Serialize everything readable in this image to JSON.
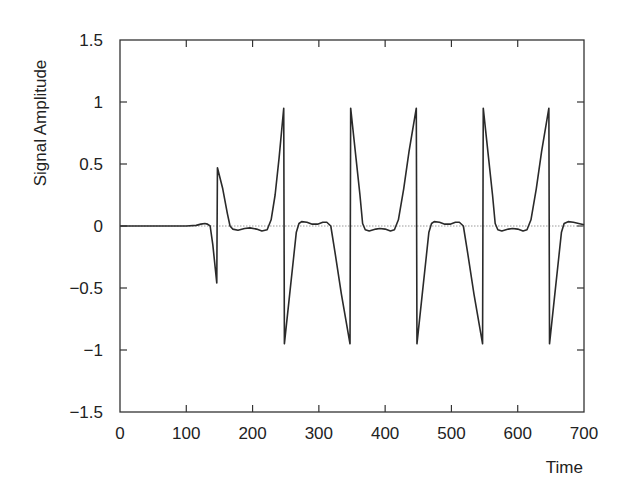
{
  "chart_data": {
    "type": "line",
    "title": "",
    "xlabel": "Time",
    "ylabel": "Signal Amplitude",
    "xlim": [
      0,
      700
    ],
    "ylim": [
      -1.5,
      1.5
    ],
    "grid": false,
    "legend": null,
    "zero_reference_line": {
      "y": 0,
      "style": "dotted",
      "color": "#9a9a9a"
    },
    "xticks": [
      0,
      100,
      200,
      300,
      400,
      500,
      600,
      700
    ],
    "xtick_labels": [
      "0",
      "100",
      "200",
      "300",
      "400",
      "500",
      "600",
      "700"
    ],
    "yticks": [
      -1.5,
      -1,
      -0.5,
      0,
      0.5,
      1,
      1.5
    ],
    "ytick_labels": [
      "−1.5",
      "−1",
      "−0.5",
      "0",
      "0.5",
      "1",
      "1.5"
    ],
    "series": [
      {
        "name": "Signal",
        "color": "#2a2a2a",
        "points": [
          [
            0,
            0
          ],
          [
            100,
            0
          ],
          [
            115,
            0.005
          ],
          [
            122,
            0.015
          ],
          [
            128,
            0.02
          ],
          [
            132,
            0.015
          ],
          [
            136,
            0.0
          ],
          [
            140,
            -0.15
          ],
          [
            146,
            -0.46
          ],
          [
            147,
            0.47
          ],
          [
            155,
            0.3
          ],
          [
            162,
            0.1
          ],
          [
            166,
            0.0
          ],
          [
            170,
            -0.025
          ],
          [
            178,
            -0.035
          ],
          [
            188,
            -0.02
          ],
          [
            196,
            -0.015
          ],
          [
            206,
            -0.025
          ],
          [
            214,
            -0.04
          ],
          [
            222,
            -0.03
          ],
          [
            228,
            0.05
          ],
          [
            234,
            0.25
          ],
          [
            240,
            0.55
          ],
          [
            247,
            0.95
          ],
          [
            248,
            -0.95
          ],
          [
            256,
            -0.55
          ],
          [
            262,
            -0.25
          ],
          [
            266,
            -0.05
          ],
          [
            270,
            0.02
          ],
          [
            274,
            0.035
          ],
          [
            282,
            0.03
          ],
          [
            290,
            0.015
          ],
          [
            298,
            0.015
          ],
          [
            306,
            0.03
          ],
          [
            312,
            0.03
          ],
          [
            318,
            0.0
          ],
          [
            324,
            -0.2
          ],
          [
            334,
            -0.55
          ],
          [
            347,
            -0.95
          ],
          [
            348,
            0.95
          ],
          [
            356,
            0.55
          ],
          [
            362,
            0.25
          ],
          [
            366,
            0.02
          ],
          [
            370,
            -0.03
          ],
          [
            376,
            -0.04
          ],
          [
            386,
            -0.025
          ],
          [
            392,
            -0.02
          ],
          [
            400,
            -0.025
          ],
          [
            408,
            -0.04
          ],
          [
            414,
            -0.03
          ],
          [
            420,
            0.05
          ],
          [
            428,
            0.3
          ],
          [
            436,
            0.6
          ],
          [
            447,
            0.95
          ],
          [
            448,
            -0.95
          ],
          [
            456,
            -0.55
          ],
          [
            462,
            -0.25
          ],
          [
            466,
            -0.05
          ],
          [
            470,
            0.02
          ],
          [
            474,
            0.035
          ],
          [
            482,
            0.03
          ],
          [
            490,
            0.015
          ],
          [
            498,
            0.015
          ],
          [
            506,
            0.03
          ],
          [
            512,
            0.03
          ],
          [
            518,
            0.0
          ],
          [
            524,
            -0.2
          ],
          [
            534,
            -0.55
          ],
          [
            547,
            -0.95
          ],
          [
            548,
            0.95
          ],
          [
            556,
            0.55
          ],
          [
            562,
            0.25
          ],
          [
            566,
            0.02
          ],
          [
            570,
            -0.03
          ],
          [
            576,
            -0.04
          ],
          [
            586,
            -0.025
          ],
          [
            592,
            -0.02
          ],
          [
            600,
            -0.025
          ],
          [
            608,
            -0.04
          ],
          [
            614,
            -0.03
          ],
          [
            620,
            0.05
          ],
          [
            628,
            0.3
          ],
          [
            636,
            0.6
          ],
          [
            647,
            0.95
          ],
          [
            648,
            -0.95
          ],
          [
            656,
            -0.55
          ],
          [
            662,
            -0.25
          ],
          [
            666,
            -0.05
          ],
          [
            670,
            0.02
          ],
          [
            676,
            0.035
          ],
          [
            684,
            0.03
          ],
          [
            692,
            0.02
          ],
          [
            700,
            0.01
          ]
        ]
      }
    ]
  },
  "layout": {
    "plot": {
      "left": 120,
      "top": 40,
      "right": 584,
      "bottom": 412
    },
    "axis_color": "#333333"
  }
}
